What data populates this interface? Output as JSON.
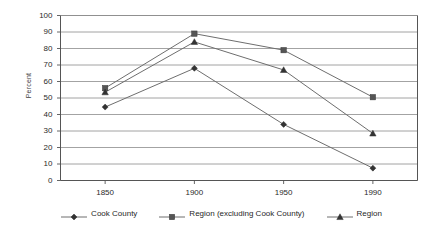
{
  "chart_data": {
    "type": "line",
    "title": "",
    "xlabel": "",
    "ylabel": "Percent",
    "categories": [
      "1850",
      "1900",
      "1950",
      "1990"
    ],
    "x_values": [
      1850,
      1900,
      1950,
      1990
    ],
    "ylim": [
      0,
      100
    ],
    "y_ticks": [
      0,
      10,
      20,
      30,
      40,
      50,
      60,
      70,
      80,
      90,
      100
    ],
    "y_tick_labels": [
      "0",
      "10",
      "20",
      "30",
      "40",
      "50",
      "60",
      "70",
      "80",
      "90",
      "100"
    ],
    "grid": "horizontal",
    "legend_position": "bottom",
    "series": [
      {
        "name": "Cook County",
        "marker": "diamond",
        "color": "#333333",
        "values": [
          44.5,
          68,
          34,
          7.5
        ]
      },
      {
        "name": "Region (excluding Cook County)",
        "marker": "square",
        "color": "#555555",
        "values": [
          56,
          89,
          79,
          50.5
        ]
      },
      {
        "name": "Region",
        "marker": "triangle",
        "color": "#333333",
        "values": [
          53.5,
          84,
          67,
          28.5
        ]
      }
    ]
  },
  "axis": {
    "y_title": "Percent"
  },
  "colors": {
    "line": "#6e6e6e",
    "grid": "#8c8c8c",
    "axis": "#555555",
    "text": "#1f1f1f"
  }
}
